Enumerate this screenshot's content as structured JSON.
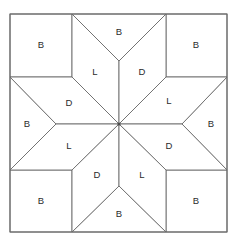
{
  "figure": {
    "width": 233,
    "height": 245,
    "background_color": "#ffffff",
    "line_color": "#6b6b6b",
    "label_color": "#2b2b2b"
  },
  "legend_keys": {
    "B": "B",
    "L": "L",
    "D": "D"
  },
  "block": {
    "frame": {
      "left": 10,
      "top": 14,
      "right": 227,
      "bottom": 232
    },
    "grid": {
      "x_divisions": [
        72,
        166
      ],
      "y_divisions": [
        77,
        170
      ],
      "center_x": 119,
      "center_y": 124
    },
    "patches": [
      {
        "id": "corner-top-left",
        "role": "corner-square",
        "label": "B",
        "points": "10,14 72,14 72,77 10,77",
        "label_x": 41,
        "label_y": 45
      },
      {
        "id": "corner-top-right",
        "role": "corner-square",
        "label": "B",
        "points": "166,14 227,14 227,77 166,77",
        "label_x": 196,
        "label_y": 45
      },
      {
        "id": "corner-bottom-left",
        "role": "corner-square",
        "label": "B",
        "points": "10,170 72,170 72,232 10,232",
        "label_x": 41,
        "label_y": 201
      },
      {
        "id": "corner-bottom-right",
        "role": "corner-square",
        "label": "B",
        "points": "166,170 227,170 227,232 166,232",
        "label_x": 196,
        "label_y": 201
      },
      {
        "id": "edge-triangle-top",
        "role": "edge-triangle",
        "label": "B",
        "points": "72,14 166,14 119,61",
        "label_x": 119,
        "label_y": 32
      },
      {
        "id": "edge-triangle-bottom",
        "role": "edge-triangle",
        "label": "B",
        "points": "72,232 166,232 119,186",
        "label_x": 119,
        "label_y": 214
      },
      {
        "id": "edge-triangle-left",
        "role": "edge-triangle",
        "label": "B",
        "points": "10,77 10,170 56,124",
        "label_x": 27,
        "label_y": 124
      },
      {
        "id": "edge-triangle-right",
        "role": "edge-triangle",
        "label": "B",
        "points": "227,77 227,170 182,124",
        "label_x": 211,
        "label_y": 124
      },
      {
        "id": "star-point-n-left",
        "role": "star-diamond",
        "label": "L",
        "points": "119,124 72,77 72,14 119,61",
        "label_x": 95,
        "label_y": 72
      },
      {
        "id": "star-point-n-right",
        "role": "star-diamond",
        "label": "D",
        "points": "119,124 119,61 166,14 166,77",
        "label_x": 142,
        "label_y": 72
      },
      {
        "id": "star-point-w-upper",
        "role": "star-diamond",
        "label": "D",
        "points": "119,124 56,124 10,77 72,77",
        "label_x": 69,
        "label_y": 103
      },
      {
        "id": "star-point-w-lower",
        "role": "star-diamond",
        "label": "L",
        "points": "119,124 72,170 10,170 56,124",
        "label_x": 69,
        "label_y": 146
      },
      {
        "id": "star-point-e-upper",
        "role": "star-diamond",
        "label": "L",
        "points": "119,124 166,77 227,77 182,124",
        "label_x": 169,
        "label_y": 101
      },
      {
        "id": "star-point-e-lower",
        "role": "star-diamond",
        "label": "D",
        "points": "119,124 182,124 227,170 166,170",
        "label_x": 169,
        "label_y": 146
      },
      {
        "id": "star-point-s-left",
        "role": "star-diamond",
        "label": "D",
        "points": "119,124 72,170 72,232 119,186",
        "label_x": 97,
        "label_y": 175
      },
      {
        "id": "star-point-s-right",
        "role": "star-diamond",
        "label": "L",
        "points": "119,124 119,186 166,232 166,170",
        "label_x": 142,
        "label_y": 175
      }
    ]
  }
}
